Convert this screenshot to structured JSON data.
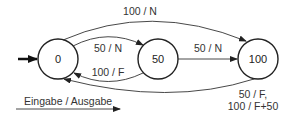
{
  "diagram": {
    "type": "state-machine",
    "states": [
      {
        "id": "s0",
        "label": "0",
        "initial": true
      },
      {
        "id": "s50",
        "label": "50"
      },
      {
        "id": "s100",
        "label": "100"
      }
    ],
    "transitions": [
      {
        "from": "0",
        "to": "100",
        "label": "100 / N"
      },
      {
        "from": "0",
        "to": "50",
        "label": "50 / N"
      },
      {
        "from": "50",
        "to": "0",
        "label": "100 / F"
      },
      {
        "from": "50",
        "to": "100",
        "label": "50 / N"
      },
      {
        "from": "100",
        "to": "0",
        "label_line1": "50 / F,",
        "label_line2": "100 / F+50"
      }
    ],
    "legend": {
      "label": "Eingabe / Ausgabe"
    },
    "colors": {
      "stroke": "#222222",
      "text": "#333333",
      "background": "#ffffff"
    }
  }
}
